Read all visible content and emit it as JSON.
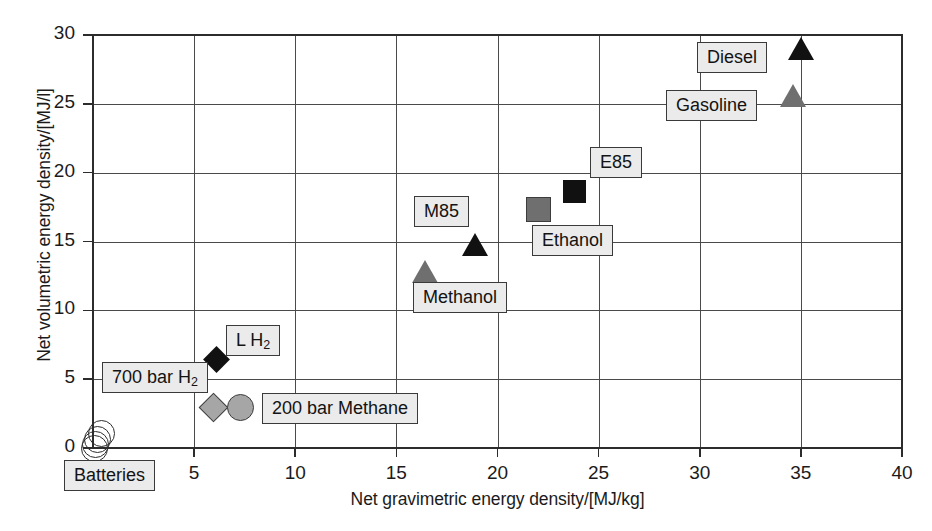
{
  "chart_data": {
    "type": "scatter",
    "title": "",
    "xlabel": "Net gravimetric energy density/[MJ/kg]",
    "ylabel": "Net volumetric energy density/[MJ/l]",
    "xlim": [
      0,
      40
    ],
    "ylim": [
      0,
      30
    ],
    "xticks": [
      0,
      5,
      10,
      15,
      20,
      25,
      30,
      35,
      40
    ],
    "xtick_labels": [
      "",
      "5",
      "10",
      "15",
      "20",
      "25",
      "30",
      "35",
      "40"
    ],
    "yticks": [
      0,
      5,
      10,
      15,
      20,
      25,
      30
    ],
    "ytick_labels": [
      "0",
      "5",
      "10",
      "15",
      "20",
      "25",
      "30"
    ],
    "grid": true,
    "legend": "none",
    "points": [
      {
        "label": "Batteries",
        "x": 0.35,
        "y": 1.15,
        "marker": "circle",
        "fill": "open"
      },
      {
        "label": "Batteries",
        "x": 0.15,
        "y": 0.75,
        "marker": "circle",
        "fill": "open"
      },
      {
        "label": "Batteries",
        "x": 0.05,
        "y": 0.35,
        "marker": "circle",
        "fill": "open"
      },
      {
        "label": "Batteries",
        "x": 0.0,
        "y": 0.05,
        "marker": "circle",
        "fill": "open"
      },
      {
        "label": "700 bar H2",
        "x": 5.9,
        "y": 3.0,
        "marker": "diamond",
        "fill": "gray"
      },
      {
        "label": "200 bar Methane",
        "x": 7.25,
        "y": 3.0,
        "marker": "circle",
        "fill": "gray"
      },
      {
        "label": "L H2",
        "x": 6.1,
        "y": 6.4,
        "marker": "diamond",
        "fill": "dark"
      },
      {
        "label": "Methanol",
        "x": 16.4,
        "y": 12.8,
        "marker": "triangle",
        "fill": "gray"
      },
      {
        "label": "M85",
        "x": 18.9,
        "y": 14.8,
        "marker": "triangle",
        "fill": "dark"
      },
      {
        "label": "Ethanol",
        "x": 22.0,
        "y": 17.4,
        "marker": "square",
        "fill": "gray"
      },
      {
        "label": "E85",
        "x": 23.8,
        "y": 18.6,
        "marker": "square",
        "fill": "dark"
      },
      {
        "label": "Gasoline",
        "x": 34.6,
        "y": 25.6,
        "marker": "triangle",
        "fill": "gray"
      },
      {
        "label": "Diesel",
        "x": 35.0,
        "y": 29.0,
        "marker": "triangle",
        "fill": "dark"
      }
    ],
    "annotations": [
      {
        "name": "batteries",
        "text": "Batteries",
        "has_subscript": false
      },
      {
        "name": "700-bar-h2",
        "text": "700 bar H",
        "sub": "2",
        "has_subscript": true
      },
      {
        "name": "l-h2",
        "text": "L H",
        "sub": "2",
        "has_subscript": true
      },
      {
        "name": "200-bar-methane",
        "text": "200 bar Methane",
        "has_subscript": false
      },
      {
        "name": "methanol",
        "text": "Methanol",
        "has_subscript": false
      },
      {
        "name": "m85",
        "text": "M85",
        "has_subscript": false
      },
      {
        "name": "ethanol",
        "text": "Ethanol",
        "has_subscript": false
      },
      {
        "name": "e85",
        "text": "E85",
        "has_subscript": false
      },
      {
        "name": "gasoline",
        "text": "Gasoline",
        "has_subscript": false
      },
      {
        "name": "diesel",
        "text": "Diesel",
        "has_subscript": false
      }
    ],
    "colors": {
      "dark_marker": "#111111",
      "gray_marker": "#6f6f6f",
      "light_gray_marker": "#a6a6a6",
      "grid": "#4a4a4a",
      "axis": "#2c2c2c",
      "callout_fill": "#ebebeb",
      "text": "#1b1b1b",
      "background": "#ffffff"
    }
  }
}
